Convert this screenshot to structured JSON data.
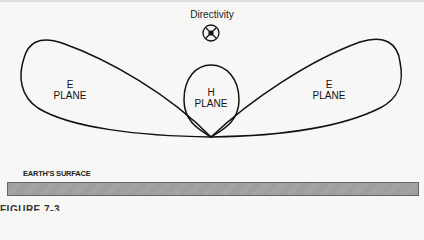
{
  "title": "Directivity",
  "directivity_symbol": "circle-x-with-center-dot",
  "lobes": {
    "left": {
      "line1": "E",
      "line2": "PLANE"
    },
    "center": {
      "line1": "H",
      "line2": "PLANE"
    },
    "right": {
      "line1": "E",
      "line2": "PLANE"
    }
  },
  "earth_label": "EARTH'S SURFACE",
  "caption": "FIGURE 7-3",
  "colors": {
    "stroke": "#111111",
    "earth_fill": "#a0a0a0",
    "background": "#f7f7f5"
  }
}
